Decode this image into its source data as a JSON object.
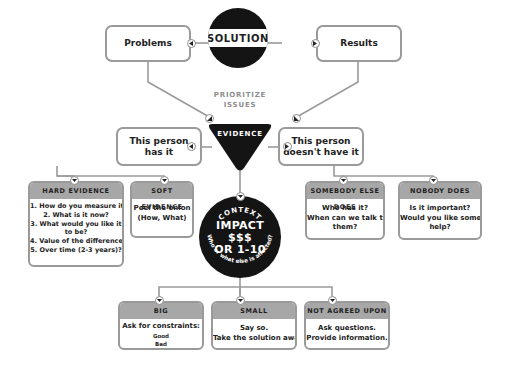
{
  "diagram": {
    "solution": "SOLUTION",
    "problems": "Problems",
    "results": "Results",
    "prioritize": [
      "PRIORITIZE",
      "ISSUES"
    ],
    "evidence": "EVIDENCE",
    "has_it": [
      "This person",
      "has it"
    ],
    "doesnt_have_it": [
      "This person",
      "doesn't have it"
    ],
    "hard_evidence": {
      "title": "HARD EVIDENCE",
      "lines": [
        "1. How do you measure it?",
        "2. What is it now?",
        "3. What would you like it",
        "to be?",
        "4. Value of the difference?",
        "5. Over time (2-3 years)?"
      ]
    },
    "soft_evidence": {
      "title": "SOFT EVIDENCE",
      "lines": [
        "Peel the onion",
        "(How, What)"
      ]
    },
    "somebody_else": {
      "title": "SOMEBODY ELSE DOES",
      "lines": [
        "Who has it?",
        "When can we talk to",
        "them?"
      ]
    },
    "nobody": {
      "title": "NOBODY DOES",
      "lines": [
        "Is it important?",
        "Would you like some",
        "help?"
      ]
    },
    "context": {
      "arc_top": "CONTEXT",
      "center": [
        "IMPACT",
        "$$$",
        "OR 1-10"
      ],
      "arc_bottom": "Who or what else is affected?"
    },
    "big": {
      "title": "BIG",
      "lines": [
        "Ask for constraints:"
      ],
      "sub": [
        "Good",
        "Bad"
      ]
    },
    "small": {
      "title": "SMALL",
      "lines": [
        "Say so.",
        "Take the solution away."
      ]
    },
    "not_agreed": {
      "title": "NOT AGREED UPON",
      "lines": [
        "Ask questions.",
        "Provide information."
      ]
    }
  },
  "colors": {
    "dark": "#141414",
    "border": "#9a9a9a",
    "header": "#a7a7a7",
    "muted_text": "#8e8e8e"
  }
}
